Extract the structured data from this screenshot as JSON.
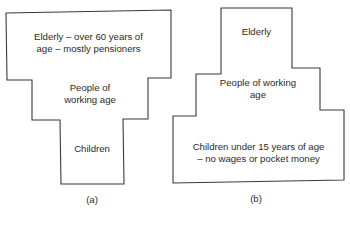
{
  "diagram_a": {
    "caption": "(a)",
    "top_line1": "Elderly – over 60 years of",
    "top_line2": "age – mostly pensioners",
    "middle_line1": "People of",
    "middle_line2": "working age",
    "bottom": "Children"
  },
  "diagram_b": {
    "caption": "(b)",
    "top": "Elderly",
    "middle_line1": "People of working",
    "middle_line2": "age",
    "bottom_line1": "Children under 15 years of age",
    "bottom_line2": "– no wages or pocket money"
  },
  "colors": {
    "stroke": "#3a3a3a",
    "text": "#2a2a2a"
  }
}
